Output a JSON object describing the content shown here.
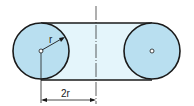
{
  "diagram": {
    "type": "geometric-figure",
    "labels": {
      "radius": "r",
      "distance": "2r"
    },
    "colors": {
      "circle_fill": "#b9dff0",
      "band_fill": "#e4f5fb",
      "stroke": "#1a1a1a",
      "background": "#ffffff"
    },
    "shapes": {
      "left_circle": {
        "cx": 41,
        "cy": 51,
        "r": 28
      },
      "right_circle": {
        "cx": 152,
        "cy": 51,
        "r": 28
      },
      "centerline_x": 96
    }
  }
}
